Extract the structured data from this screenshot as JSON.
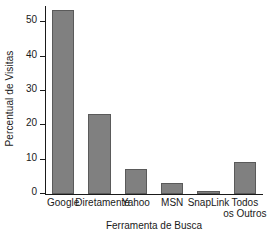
{
  "chart_data": {
    "type": "bar",
    "title": "",
    "xlabel": "Ferramenta de Busca",
    "ylabel": "Percentual de Visitas",
    "categories": [
      "Google",
      "Diretamente",
      "Yahoo",
      "MSN",
      "SnapLink",
      "Todos os Outros"
    ],
    "category_lines": [
      [
        "Google"
      ],
      [
        "Diretamente"
      ],
      [
        "Yahoo"
      ],
      [
        "MSN"
      ],
      [
        "SnapLink"
      ],
      [
        "Todos",
        "os Outros"
      ]
    ],
    "values": [
      53.5,
      23.3,
      7.2,
      3.1,
      1.0,
      9.3
    ],
    "ylim": [
      0,
      55
    ],
    "yticks": [
      0,
      10,
      20,
      30,
      40,
      50
    ],
    "ytick_labels": [
      "0",
      "10",
      "20",
      "30",
      "40",
      "50"
    ],
    "grid": false,
    "legend": false,
    "bar_color": "#808080",
    "bar_edge_color": "#5a5a5a",
    "axis_color": "#1a1a1a"
  }
}
